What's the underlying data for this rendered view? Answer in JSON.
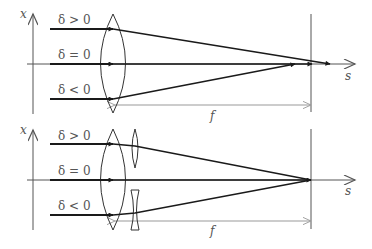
{
  "colors": {
    "background": "#ffffff",
    "ray": "#1a1a1a",
    "axis": "#555555",
    "dimension": "#999999",
    "lens": "#333333",
    "label": "#555555"
  },
  "panels": [
    {
      "name": "single-lens",
      "axis_x_label": "x",
      "axis_s_label": "s",
      "focal_label": "f",
      "rays": [
        {
          "label": "δ > 0",
          "sign": "positive"
        },
        {
          "label": "δ = 0",
          "sign": "zero"
        },
        {
          "label": "δ < 0",
          "sign": "negative"
        }
      ],
      "lenses": [
        "converging-lens"
      ]
    },
    {
      "name": "corrected-lens",
      "axis_x_label": "x",
      "axis_s_label": "s",
      "focal_label": "f",
      "rays": [
        {
          "label": "δ > 0",
          "sign": "positive"
        },
        {
          "label": "δ = 0",
          "sign": "zero"
        },
        {
          "label": "δ < 0",
          "sign": "negative"
        }
      ],
      "lenses": [
        "converging-lens",
        "small-converging-lens",
        "small-diverging-lens"
      ]
    }
  ]
}
